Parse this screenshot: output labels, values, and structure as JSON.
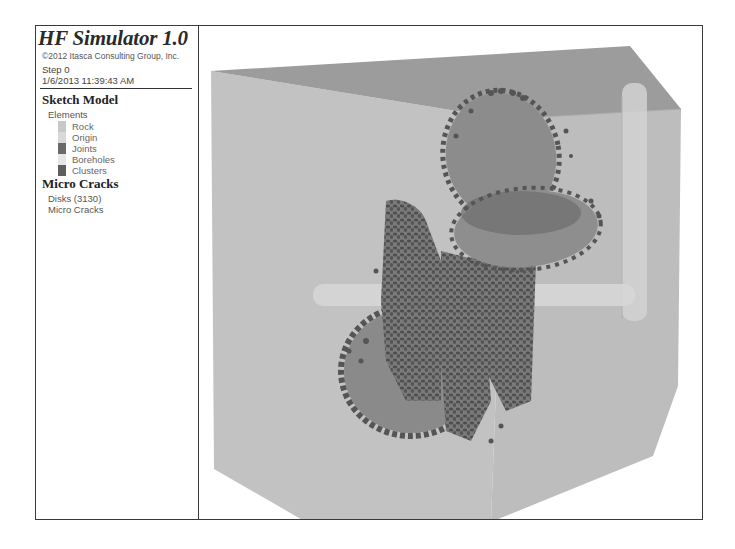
{
  "legend": {
    "title": "HF Simulator 1.0",
    "copyright": "©2012 Itasca Consulting Group, Inc.",
    "step": "Step 0",
    "timestamp": "1/6/2013 11:39:43 AM",
    "sketch_model": {
      "heading": "Sketch Model",
      "elements_label": "Elements",
      "items": [
        {
          "label": "Rock",
          "color": "#c8c8c8"
        },
        {
          "label": "Origin",
          "color": "#d8d8d8"
        },
        {
          "label": "Joints",
          "color": "#6a6a6a"
        },
        {
          "label": "Boreholes",
          "color": "#e6e6e6"
        },
        {
          "label": "Clusters",
          "color": "#5e5e5e"
        }
      ]
    },
    "micro_cracks": {
      "heading": "Micro Cracks",
      "disks": "Disks (3130)",
      "label": "Micro Cracks"
    }
  },
  "viewport": {
    "colors": {
      "rock_top": "#9a9a9a",
      "rock_side": "#c2c2c2",
      "rock_right": "#b8b8b8",
      "joint_disk": "#858585",
      "cluster": "#555555",
      "borehole": "#d9d9d9"
    }
  }
}
